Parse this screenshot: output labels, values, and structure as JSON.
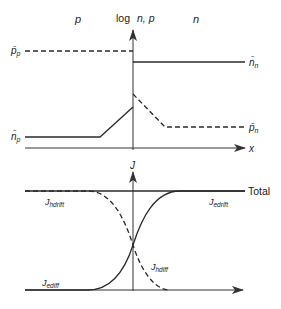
{
  "top_plot": {
    "region_p_label": "p",
    "region_n_label": "n",
    "y_axis_label_log": "log",
    "y_axis_label_vars": "n, p",
    "x_axis_label": "x",
    "curves": {
      "pp_label": "p̄",
      "pp_sub": "p",
      "nn_label": "n̄",
      "nn_sub": "n",
      "np_label": "n̄",
      "np_sub": "p",
      "pn_label": "p̄",
      "pn_sub": "n"
    }
  },
  "bottom_plot": {
    "y_axis_label": "J",
    "total_label": "Total",
    "jhdrift_main": "J",
    "jhdrift_sub": "hdrift",
    "jedrift_main": "J",
    "jedrift_sub": "edrift",
    "jhdiff_main": "J",
    "jhdiff_sub": "hdiff",
    "jediff_main": "J",
    "jediff_sub": "ediff"
  },
  "colors": {
    "line": "#2a2a2a",
    "axis": "#333333"
  }
}
